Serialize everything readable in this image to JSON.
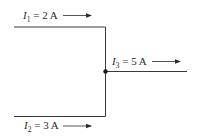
{
  "diagram": {
    "type": "circuit-junction",
    "wire_color": "#3a3a3a",
    "currents": [
      {
        "id": "I1",
        "symbol": "I",
        "subscript": "1",
        "equals": " = ",
        "value": "2 A",
        "direction": "right",
        "position": "top-left wire"
      },
      {
        "id": "I2",
        "symbol": "I",
        "subscript": "2",
        "equals": " = ",
        "value": "3 A",
        "direction": "right",
        "position": "bottom-left wire"
      },
      {
        "id": "I3",
        "symbol": "I",
        "subscript": "3",
        "equals": " = ",
        "value": "5 A",
        "direction": "right",
        "position": "right output wire"
      }
    ],
    "junction": {
      "label": "junction node"
    }
  }
}
